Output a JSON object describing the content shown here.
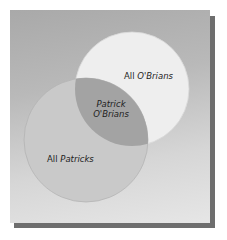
{
  "diagram": {
    "type": "venn",
    "sets": [
      {
        "id": "obrians",
        "label_prefix": "All ",
        "label_emph": "O'Brians",
        "color": "#eeeeee"
      },
      {
        "id": "patricks",
        "label_prefix": "All ",
        "label_emph": "Patricks",
        "color": "#c9c9c9"
      }
    ],
    "intersection": {
      "line1": "Patrick",
      "line2": "O'Brians",
      "color": "#a3a3a3"
    },
    "colors": {
      "card_top": "#a9a9a9",
      "card_bottom": "#e6e6e6",
      "shadow": "#6e6e6e"
    }
  }
}
